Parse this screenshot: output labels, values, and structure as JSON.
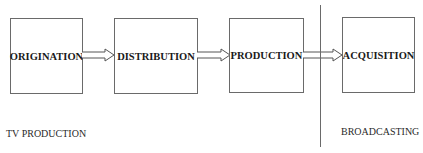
{
  "diagram": {
    "stages": [
      {
        "label": "ORIGINATION"
      },
      {
        "label": "DISTRIBUTION"
      },
      {
        "label": "PRODUCTION"
      },
      {
        "label": "ACQUISITION"
      }
    ],
    "sections": {
      "left": "TV PRODUCTION",
      "right": "BROADCASTING"
    }
  }
}
